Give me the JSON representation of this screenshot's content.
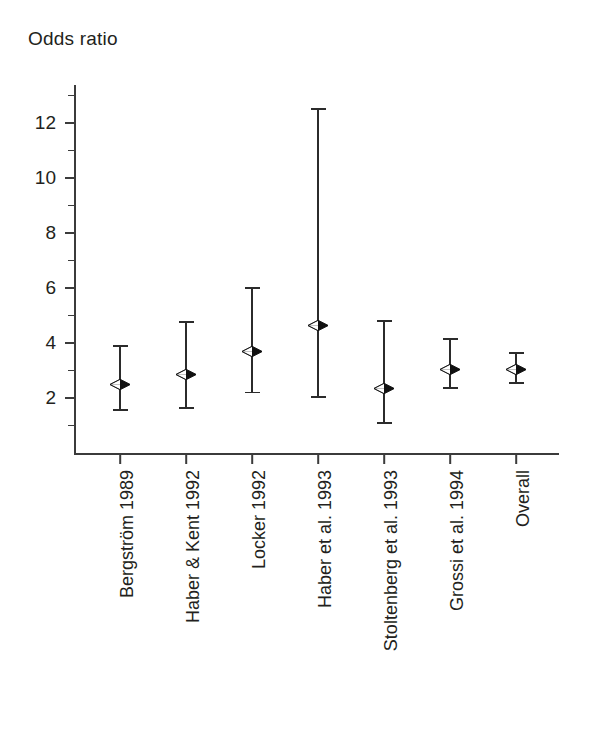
{
  "figure": {
    "axis_title": "Odds ratio",
    "background_color": "#ffffff",
    "ink_color": "#231f20"
  },
  "chart_data": {
    "type": "scatter",
    "title": "Odds ratio",
    "subtitle": "",
    "xlabel": "",
    "ylabel": "Odds ratio",
    "ylim": [
      0,
      13
    ],
    "yticks": [
      2,
      4,
      6,
      8,
      10,
      12
    ],
    "ytick_labels": [
      "2",
      "4",
      "6",
      "8",
      "10",
      "12"
    ],
    "minor_yticks": [
      1,
      3,
      5,
      7,
      9,
      11,
      13
    ],
    "grid": false,
    "legend": "none",
    "marker": "diamond",
    "error_bars": "95% confidence interval",
    "categories": [
      "Bergström 1989",
      "Haber & Kent 1992",
      "Locker 1992",
      "Haber et al. 1993",
      "Stoltenberg et al. 1993",
      "Grossi et al. 1994",
      "Overall"
    ],
    "values": [
      2.5,
      2.85,
      3.7,
      4.65,
      2.35,
      3.05,
      3.05
    ],
    "ci_lower": [
      1.55,
      1.65,
      2.2,
      2.05,
      1.1,
      2.35,
      2.55
    ],
    "ci_upper": [
      3.9,
      4.75,
      6.0,
      12.5,
      4.8,
      4.15,
      3.65
    ],
    "points": [
      {
        "label": "Bergström 1989",
        "odds_ratio": 2.5,
        "ci_low": 1.55,
        "ci_high": 3.9
      },
      {
        "label": "Haber & Kent 1992",
        "odds_ratio": 2.85,
        "ci_low": 1.65,
        "ci_high": 4.75
      },
      {
        "label": "Locker 1992",
        "odds_ratio": 3.7,
        "ci_low": 2.2,
        "ci_high": 6.0
      },
      {
        "label": "Haber et al. 1993",
        "odds_ratio": 4.65,
        "ci_low": 2.05,
        "ci_high": 12.5
      },
      {
        "label": "Stoltenberg et al. 1993",
        "odds_ratio": 2.35,
        "ci_low": 1.1,
        "ci_high": 4.8
      },
      {
        "label": "Grossi et al. 1994",
        "odds_ratio": 3.05,
        "ci_low": 2.35,
        "ci_high": 4.15
      },
      {
        "label": "Overall",
        "odds_ratio": 3.05,
        "ci_low": 2.55,
        "ci_high": 3.65
      }
    ]
  }
}
